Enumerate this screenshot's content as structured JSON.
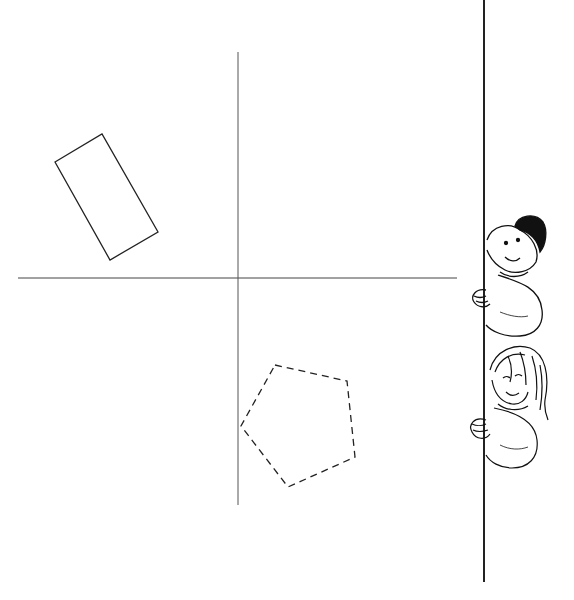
{
  "diagram": {
    "colors": {
      "line": "#222222",
      "axis": "#444444",
      "background": "#ffffff"
    },
    "axes": {
      "horizontal": {
        "x1": 18,
        "y1": 278,
        "x2": 457,
        "y2": 278
      },
      "vertical": {
        "x1": 238,
        "y1": 52,
        "x2": 238,
        "y2": 505
      }
    },
    "shapes": [
      {
        "name": "rectangle",
        "style": "solid",
        "points": "55,162 102,134 158,232 110,260"
      },
      {
        "name": "pentagon",
        "style": "dashed",
        "points": "275,365 347,381 355,457 288,487 241,426"
      }
    ],
    "wall": {
      "x": 484,
      "y1": 0,
      "y2": 582
    },
    "characters": [
      {
        "name": "boy",
        "position": "upper"
      },
      {
        "name": "girl",
        "position": "lower"
      }
    ]
  }
}
